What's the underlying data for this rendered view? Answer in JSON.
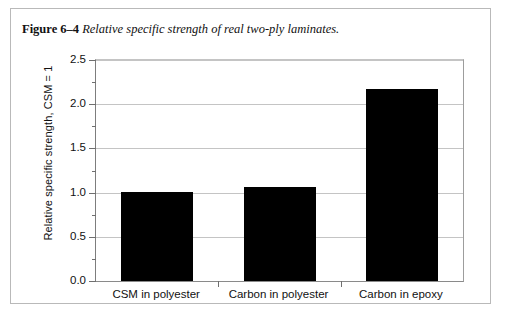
{
  "caption": {
    "figure_label": "Figure 6–4",
    "title": "Relative specific strength of real two-ply laminates."
  },
  "chart_data": {
    "type": "bar",
    "title": "Relative specific strength of real two-ply laminates.",
    "categories": [
      "CSM in polyester",
      "Carbon in polyester",
      "Carbon in epoxy"
    ],
    "values": [
      1.01,
      1.06,
      2.17
    ],
    "xlabel": "",
    "ylabel": "Relative specific strength, CSM = 1",
    "ylim": [
      0.0,
      2.5
    ],
    "ytick_labels": [
      "0.0",
      "0.5",
      "1.0",
      "1.5",
      "2.0",
      "2.5"
    ],
    "ytick_values": [
      0.0,
      0.5,
      1.0,
      1.5,
      2.0,
      2.5
    ],
    "yminor_values": [
      0.25,
      0.75,
      1.25,
      1.75,
      2.25
    ],
    "grid": true,
    "legend": "none",
    "bar_color": "#000000",
    "grid_color": "#c4c4c4",
    "axis_color": "#8a8a8a"
  }
}
